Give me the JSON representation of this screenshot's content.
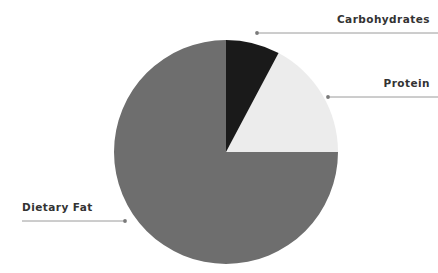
{
  "chart_data": {
    "type": "pie",
    "title": "",
    "subtitle": "",
    "xlabel": "",
    "ylabel": "",
    "legend_position": "none",
    "grid": false,
    "labels_as_annotations": true,
    "start_angle_deg": 0,
    "direction": "clockwise",
    "categories": [
      "Carbohydrates",
      "Protein",
      "Dietary Fat"
    ],
    "values": [
      7.8,
      17.2,
      75.0
    ],
    "units": "percent",
    "slices": [
      {
        "label": "Carbohydrates",
        "value": 7.8,
        "color": "#1a1a1a",
        "start_angle_deg": 0,
        "end_angle_deg": 28
      },
      {
        "label": "Protein",
        "value": 17.2,
        "color": "#ececec",
        "start_angle_deg": 28,
        "end_angle_deg": 90
      },
      {
        "label": "Dietary Fat",
        "value": 75.0,
        "color": "#6e6e6e",
        "start_angle_deg": 90,
        "end_angle_deg": 360
      }
    ]
  },
  "geometry": {
    "center_x": 226,
    "center_y": 152,
    "radius": 112
  },
  "annotations": [
    {
      "id": "carbohydrates",
      "text": "Carbohydrates",
      "line": {
        "x1": 256,
        "y1": 33,
        "x2": 438,
        "y2": 33
      },
      "dot": {
        "x": 257,
        "y": 33
      },
      "dot_side": "left"
    },
    {
      "id": "protein",
      "text": "Protein",
      "line": {
        "x1": 327,
        "y1": 97,
        "x2": 438,
        "y2": 97
      },
      "dot": {
        "x": 328,
        "y": 97
      },
      "dot_side": "left"
    },
    {
      "id": "dietary_fat",
      "text": "Dietary Fat",
      "line": {
        "x1": 22,
        "y1": 221,
        "x2": 126,
        "y2": 221
      },
      "dot": {
        "x": 125,
        "y": 221
      },
      "dot_side": "right"
    }
  ],
  "style": {
    "background": "#ffffff",
    "text_color": "#333333",
    "leader_line_color": "#9a9a9a",
    "leader_dot_color": "#7a7a7a"
  }
}
